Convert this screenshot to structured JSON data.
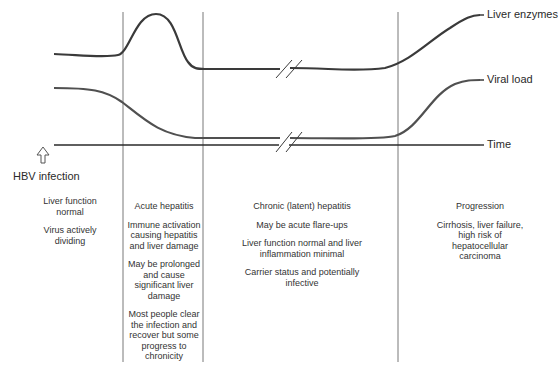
{
  "series_labels": {
    "liver_enzymes": "Liver enzymes",
    "viral_load": "Viral load",
    "time": "Time"
  },
  "event": {
    "label": "HBV infection",
    "icon": "up-arrow-icon"
  },
  "phases": [
    {
      "title": "",
      "notes": [
        "Liver function normal",
        "Virus actively dividing"
      ]
    },
    {
      "title": "Acute hepatitis",
      "notes": [
        "Immune activation causing hepatitis and liver damage",
        "May be prolonged and cause significant liver damage",
        "Most people clear the infection and recover but some progress to chronicity"
      ]
    },
    {
      "title": "Chronic (latent) hepatitis",
      "notes": [
        "May be acute flare-ups",
        "Liver function normal and liver inflammation minimal",
        "Carrier status and potentially infective"
      ]
    },
    {
      "title": "Progression",
      "notes": [
        "Cirrhosis, liver failure, high risk of hepatocellular carcinoma"
      ]
    }
  ],
  "colors": {
    "curve": "#3a3a3a",
    "divider": "#555555",
    "text": "#2a2a2a"
  }
}
